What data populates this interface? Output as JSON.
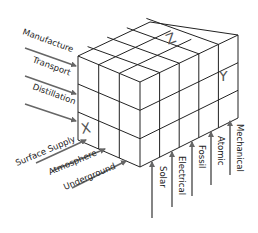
{
  "diagram": {
    "type": "3d-matrix-cube",
    "axes": {
      "x": "X",
      "y": "Y",
      "z": "Z"
    },
    "left_labels": [
      "Manufacture",
      "Transport",
      "Distillation"
    ],
    "bottom_left_labels": [
      "Surface Supply",
      "Atmosphere",
      "Underground"
    ],
    "bottom_right_labels": [
      "Solar",
      "Electrical",
      "Fossil",
      "Atomic",
      "Mechanical"
    ],
    "colors": {
      "lines": "#222222",
      "arrows": "#666666",
      "axis_letters": "#555555"
    }
  }
}
